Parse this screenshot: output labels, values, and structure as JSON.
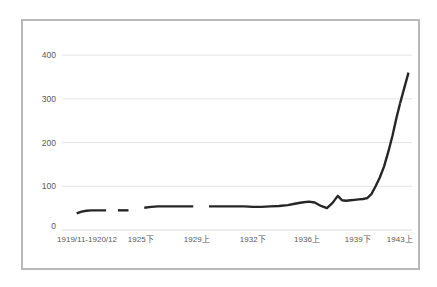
{
  "chart_data": {
    "type": "line",
    "title": "",
    "xlabel": "",
    "ylabel": "",
    "ylim": [
      0,
      430
    ],
    "yticks": [
      0,
      100,
      200,
      300,
      400
    ],
    "ytick_labels": [
      "0",
      "100",
      "200",
      "300",
      "400"
    ],
    "grid": true,
    "legend": "none",
    "xtick_labels": [
      "1919/11-1920/12",
      "1925下",
      "1929上",
      "1932下",
      "1936上",
      "1939下",
      "1943上"
    ],
    "xtick_positions": [
      0.055,
      0.225,
      0.385,
      0.545,
      0.7,
      0.845,
      0.965
    ],
    "line_color": "#262626",
    "series": [
      {
        "name": "series-1",
        "segments": [
          {
            "x": [
              0.042,
              0.056,
              0.07,
              0.084,
              0.098,
              0.112,
              0.126
            ],
            "values": [
              38,
              42,
              44,
              45,
              45,
              45,
              45
            ]
          },
          {
            "x": [
              0.16,
              0.175,
              0.19
            ],
            "values": [
              45,
              45,
              45
            ]
          },
          {
            "x": [
              0.235,
              0.255,
              0.275,
              0.295,
              0.315,
              0.335,
              0.355,
              0.375
            ],
            "values": [
              51,
              53,
              54,
              54,
              54,
              54,
              54,
              54
            ]
          },
          {
            "x": [
              0.42,
              0.445,
              0.47,
              0.495,
              0.52,
              0.545,
              0.57,
              0.595,
              0.62,
              0.645,
              0.665,
              0.685,
              0.705,
              0.722,
              0.74,
              0.757,
              0.773,
              0.788,
              0.8,
              0.812,
              0.824,
              0.836,
              0.848,
              0.86,
              0.872,
              0.884,
              0.896,
              0.908,
              0.92,
              0.932,
              0.944,
              0.956,
              0.966
            ],
            "values": [
              54,
              54,
              54,
              54,
              54,
              53,
              53,
              54,
              55,
              57,
              60,
              63,
              65,
              63,
              55,
              50,
              62,
              78,
              68,
              67,
              68,
              69,
              70,
              71,
              73,
              82,
              100,
              120,
              145,
              178,
              215,
              258,
              290
            ]
          },
          {
            "x": [
              0.966,
              0.978,
              0.99
            ],
            "values": [
              290,
              325,
              360
            ]
          }
        ]
      }
    ]
  }
}
